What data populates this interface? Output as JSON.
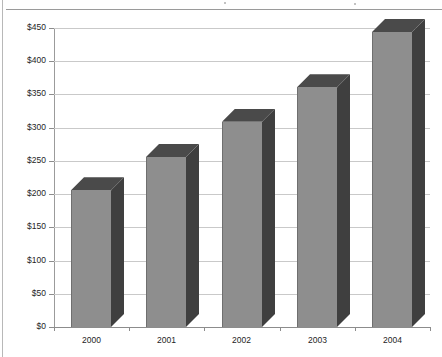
{
  "chart_data": {
    "type": "bar",
    "title": "",
    "subtitle": "",
    "xlabel": "",
    "ylabel": "",
    "categories": [
      "2000",
      "2001",
      "2002",
      "2003",
      "2004"
    ],
    "values": [
      206,
      256,
      309,
      361,
      444
    ],
    "series": [
      {
        "name": "",
        "values": [
          206,
          256,
          309,
          361,
          444
        ]
      }
    ],
    "ylim": [
      0,
      450
    ],
    "ytick_values": [
      0,
      50,
      100,
      150,
      200,
      250,
      300,
      350,
      400,
      450
    ],
    "ytick_labels": [
      "$0",
      "$50",
      "$100",
      "$150",
      "$200",
      "$250",
      "$300",
      "$350",
      "$400",
      "$450"
    ],
    "xtick_labels": [
      "2000",
      "2001",
      "2002",
      "2003",
      "2004"
    ],
    "grid": true,
    "legend": false,
    "legend_position": "none",
    "style": "3d-bar",
    "annotations": []
  },
  "colors": {
    "bar_front": "#8e8e8e",
    "bar_side": "#3f3f3f",
    "bar_top": "#4a4a4a",
    "bar_edge": "#6f6f6f",
    "gridline": "#c9c9c9",
    "axis": "#8c8c8c",
    "text": "#242424",
    "background": "#ffffff",
    "rule": "#9a9a9a"
  }
}
